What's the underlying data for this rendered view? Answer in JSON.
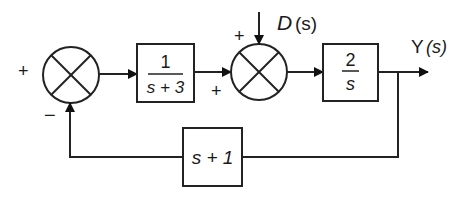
{
  "diagram": {
    "type": "block-diagram",
    "summing_junctions": [
      {
        "id": "sum1",
        "signs": {
          "left": "+",
          "bottom": "−"
        }
      },
      {
        "id": "sum2",
        "signs": {
          "top": "+",
          "left": "+"
        }
      }
    ],
    "blocks": {
      "g1": {
        "numerator": "1",
        "denominator": "s + 3"
      },
      "g2": {
        "numerator": "2",
        "denominator": "s"
      },
      "h": {
        "label": "s + 1"
      }
    },
    "signals": {
      "disturbance": {
        "name": "D",
        "arg": "(s)"
      },
      "output": {
        "name": "Y",
        "arg": "(s)"
      }
    },
    "colors": {
      "stroke": "#222222",
      "background": "#ffffff"
    }
  }
}
